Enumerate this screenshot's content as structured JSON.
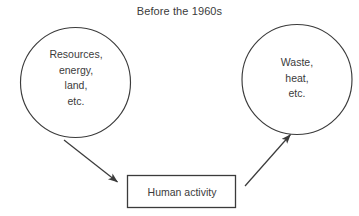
{
  "title": "Before the 1960s",
  "colors": {
    "background": "#ffffff",
    "stroke": "#3b3b3b",
    "text": "#3b3b3b"
  },
  "nodes": {
    "inputs_circle": {
      "shape": "circle",
      "lines": [
        "Resources,",
        "energy,",
        "land,",
        "etc."
      ],
      "cx": 75.5,
      "cy": 82.5,
      "r": 55
    },
    "outputs_circle": {
      "shape": "circle",
      "lines": [
        "Waste,",
        "heat,",
        "etc."
      ],
      "cx": 297,
      "cy": 79.5,
      "r": 55
    },
    "activity_box": {
      "shape": "rectangle",
      "label": "Human activity",
      "x": 127,
      "y": 175,
      "width": 109,
      "height": 33
    }
  },
  "arrows": [
    {
      "name": "inputs-to-activity",
      "from": "inputs_circle",
      "to": "activity_box",
      "x1": 64,
      "y1": 140,
      "x2": 120,
      "y2": 184
    },
    {
      "name": "activity-to-outputs",
      "from": "activity_box",
      "to": "outputs_circle",
      "x1": 245,
      "y1": 186,
      "x2": 289,
      "y2": 136
    }
  ]
}
